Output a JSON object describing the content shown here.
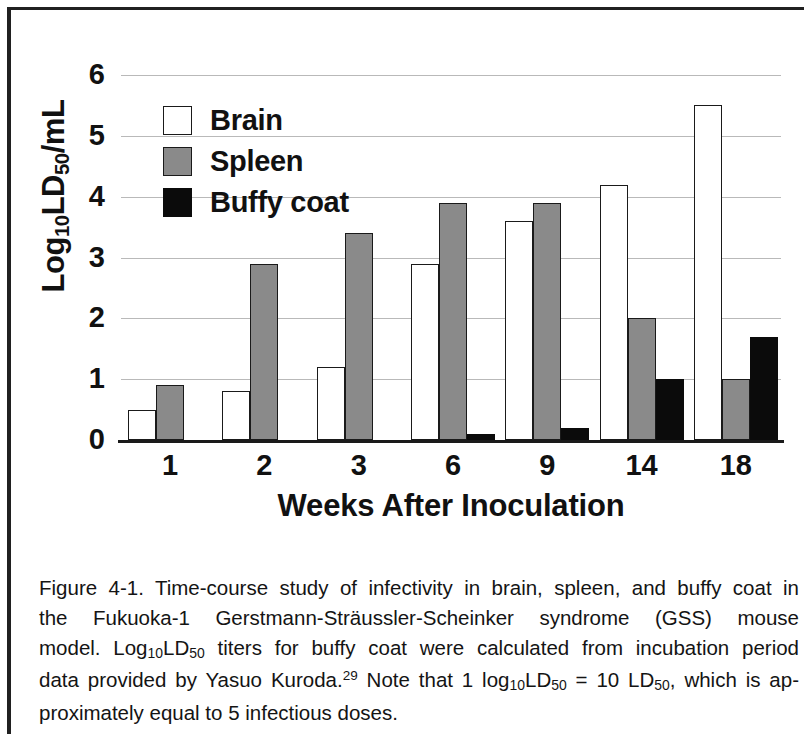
{
  "figure": {
    "y_axis_title_main": "Log",
    "y_axis_title_sub1": "10",
    "y_axis_title_mid": "LD",
    "y_axis_title_sub2": "50",
    "y_axis_title_end": "/mL",
    "x_axis_title": "Weeks After Inoculation"
  },
  "legend": {
    "items": [
      {
        "label": "Brain",
        "color": "#ffffff",
        "key": "brain"
      },
      {
        "label": "Spleen",
        "color": "#8a8a8a",
        "key": "spleen"
      },
      {
        "label": "Buffy coat",
        "color": "#0b0b0b",
        "key": "buffy"
      }
    ]
  },
  "caption": {
    "line1_a": "Figure 4-1. Time-course study of infectivity in brain, spleen, and buffy coat in",
    "line2_a": "the Fukuoka-1 Gerstmann-Sträussler-Scheinker syndrome (GSS) mouse",
    "line3_a": "model. Log",
    "line3_sub1": "10",
    "line3_b": "LD",
    "line3_sub2": "50",
    "line3_c": " titers for buffy coat were calculated from incubation period",
    "line4_a": "data provided by Yasuo Kuroda.",
    "line4_sup": "29",
    "line4_b": " Note that 1 log",
    "line4_sub1": "10",
    "line4_c": "LD",
    "line4_sub2": "50",
    "line4_d": " = 10 LD",
    "line4_sub3": "50",
    "line4_e": ", which is ap-",
    "line5_a": "proximately equal to 5 infectious doses."
  },
  "chart_data": {
    "type": "bar",
    "title": "",
    "xlabel": "Weeks After Inoculation",
    "ylabel": "Log10LD50/mL",
    "categories": [
      "1",
      "2",
      "3",
      "6",
      "9",
      "14",
      "18"
    ],
    "ylim": [
      0,
      6
    ],
    "yticks": [
      0,
      1,
      2,
      3,
      4,
      5,
      6
    ],
    "ytick_labels": [
      "0",
      "1",
      "2",
      "3",
      "4",
      "5",
      "6"
    ],
    "grid": true,
    "legend_position": "upper-left-inside",
    "series": [
      {
        "name": "Brain",
        "color": "#ffffff",
        "key": "brain",
        "values": [
          0.5,
          0.8,
          1.2,
          2.9,
          3.6,
          4.2,
          5.5
        ]
      },
      {
        "name": "Spleen",
        "color": "#8a8a8a",
        "key": "spleen",
        "values": [
          0.9,
          2.9,
          3.4,
          3.9,
          3.9,
          2.0,
          1.0
        ]
      },
      {
        "name": "Buffy coat",
        "color": "#0b0b0b",
        "key": "buffy",
        "values": [
          0,
          0,
          0,
          0.1,
          0.2,
          1.0,
          1.7
        ]
      }
    ]
  }
}
